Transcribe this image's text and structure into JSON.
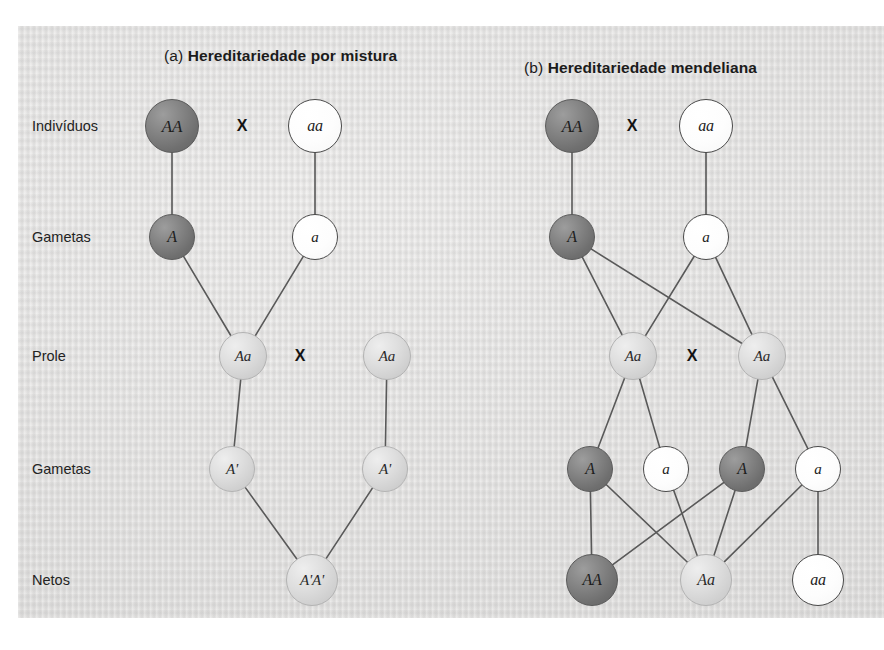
{
  "figure": {
    "background_color": "#e3e2e1",
    "page_color": "#ffffff",
    "line_color": "#595959"
  },
  "row_labels": [
    {
      "id": "individuos",
      "text": "Indivíduos",
      "y": 126
    },
    {
      "id": "gametas-1",
      "text": "Gametas",
      "y": 237
    },
    {
      "id": "prole",
      "text": "Prole",
      "y": 356
    },
    {
      "id": "gametas-2",
      "text": "Gametas",
      "y": 469
    },
    {
      "id": "netos",
      "text": "Netos",
      "y": 580
    }
  ],
  "panels": [
    {
      "id": "a",
      "tag": "(a)",
      "title": "Hereditariedade por mistura",
      "cross_symbol": "X",
      "crosses": [
        {
          "label": "X",
          "x": 242,
          "y": 126
        },
        {
          "label": "X",
          "x": 300,
          "y": 356
        }
      ],
      "nodes": [
        {
          "id": "a-ind-1",
          "label": "AA",
          "shade": "dark",
          "x": 172,
          "y": 126,
          "r": 27,
          "font": 17
        },
        {
          "id": "a-ind-2",
          "label": "aa",
          "shade": "white",
          "x": 315,
          "y": 126,
          "r": 27,
          "font": 16
        },
        {
          "id": "a-gam-1",
          "label": "A",
          "shade": "dark",
          "x": 172,
          "y": 237,
          "r": 23,
          "font": 16
        },
        {
          "id": "a-gam-2",
          "label": "a",
          "shade": "white",
          "x": 315,
          "y": 237,
          "r": 23,
          "font": 15
        },
        {
          "id": "a-pro-1",
          "label": "Aa",
          "shade": "light",
          "x": 243,
          "y": 356,
          "r": 24,
          "font": 15
        },
        {
          "id": "a-pro-2",
          "label": "Aa",
          "shade": "light",
          "x": 387,
          "y": 356,
          "r": 24,
          "font": 15
        },
        {
          "id": "a-gam2-1",
          "label": "A'",
          "shade": "light",
          "x": 232,
          "y": 469,
          "r": 23,
          "font": 15
        },
        {
          "id": "a-gam2-2",
          "label": "A'",
          "shade": "light",
          "x": 385,
          "y": 469,
          "r": 23,
          "font": 15
        },
        {
          "id": "a-net-1",
          "label": "A'A'",
          "shade": "light",
          "x": 312,
          "y": 580,
          "r": 26,
          "font": 15
        }
      ],
      "edges": [
        {
          "from": "a-ind-1",
          "to": "a-gam-1"
        },
        {
          "from": "a-ind-2",
          "to": "a-gam-2"
        },
        {
          "from": "a-gam-1",
          "to": "a-pro-1"
        },
        {
          "from": "a-gam-2",
          "to": "a-pro-1"
        },
        {
          "from": "a-pro-1",
          "to": "a-gam2-1"
        },
        {
          "from": "a-pro-2",
          "to": "a-gam2-2"
        },
        {
          "from": "a-gam2-1",
          "to": "a-net-1"
        },
        {
          "from": "a-gam2-2",
          "to": "a-net-1"
        }
      ]
    },
    {
      "id": "b",
      "tag": "(b)",
      "title": "Hereditariedade mendeliana",
      "cross_symbol": "X",
      "crosses": [
        {
          "label": "X",
          "x": 632,
          "y": 126
        },
        {
          "label": "X",
          "x": 692,
          "y": 356
        }
      ],
      "nodes": [
        {
          "id": "b-ind-1",
          "label": "AA",
          "shade": "dark",
          "x": 572,
          "y": 126,
          "r": 27,
          "font": 17
        },
        {
          "id": "b-ind-2",
          "label": "aa",
          "shade": "white",
          "x": 706,
          "y": 126,
          "r": 27,
          "font": 16
        },
        {
          "id": "b-gam-1",
          "label": "A",
          "shade": "dark",
          "x": 572,
          "y": 237,
          "r": 23,
          "font": 16
        },
        {
          "id": "b-gam-2",
          "label": "a",
          "shade": "white",
          "x": 706,
          "y": 237,
          "r": 23,
          "font": 15
        },
        {
          "id": "b-pro-1",
          "label": "Aa",
          "shade": "light",
          "x": 633,
          "y": 356,
          "r": 24,
          "font": 15
        },
        {
          "id": "b-pro-2",
          "label": "Aa",
          "shade": "light",
          "x": 762,
          "y": 356,
          "r": 24,
          "font": 15
        },
        {
          "id": "b-gam2-1",
          "label": "A",
          "shade": "dark",
          "x": 590,
          "y": 469,
          "r": 23,
          "font": 16
        },
        {
          "id": "b-gam2-2",
          "label": "a",
          "shade": "white",
          "x": 666,
          "y": 469,
          "r": 23,
          "font": 15
        },
        {
          "id": "b-gam2-3",
          "label": "A",
          "shade": "dark",
          "x": 742,
          "y": 469,
          "r": 23,
          "font": 16
        },
        {
          "id": "b-gam2-4",
          "label": "a",
          "shade": "white",
          "x": 818,
          "y": 469,
          "r": 23,
          "font": 15
        },
        {
          "id": "b-net-1",
          "label": "AA",
          "shade": "dark",
          "x": 592,
          "y": 580,
          "r": 26,
          "font": 16
        },
        {
          "id": "b-net-2",
          "label": "Aa",
          "shade": "light",
          "x": 706,
          "y": 580,
          "r": 26,
          "font": 16
        },
        {
          "id": "b-net-3",
          "label": "aa",
          "shade": "white",
          "x": 818,
          "y": 580,
          "r": 26,
          "font": 16
        }
      ],
      "edges": [
        {
          "from": "b-ind-1",
          "to": "b-gam-1"
        },
        {
          "from": "b-ind-2",
          "to": "b-gam-2"
        },
        {
          "from": "b-gam-1",
          "to": "b-pro-1"
        },
        {
          "from": "b-gam-2",
          "to": "b-pro-1"
        },
        {
          "from": "b-gam-1",
          "to": "b-pro-2"
        },
        {
          "from": "b-gam-2",
          "to": "b-pro-2"
        },
        {
          "from": "b-pro-1",
          "to": "b-gam2-1"
        },
        {
          "from": "b-pro-1",
          "to": "b-gam2-2"
        },
        {
          "from": "b-pro-2",
          "to": "b-gam2-3"
        },
        {
          "from": "b-pro-2",
          "to": "b-gam2-4"
        },
        {
          "from": "b-gam2-1",
          "to": "b-net-1"
        },
        {
          "from": "b-gam2-1",
          "to": "b-net-2"
        },
        {
          "from": "b-gam2-2",
          "to": "b-net-2"
        },
        {
          "from": "b-gam2-3",
          "to": "b-net-1"
        },
        {
          "from": "b-gam2-3",
          "to": "b-net-2"
        },
        {
          "from": "b-gam2-4",
          "to": "b-net-2"
        },
        {
          "from": "b-gam2-4",
          "to": "b-net-3"
        }
      ]
    }
  ]
}
